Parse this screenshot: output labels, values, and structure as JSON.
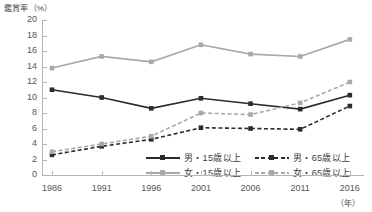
{
  "chart_data": {
    "type": "line",
    "title": "鑑賞率（%）",
    "ylabel": "鑑賞率（%）",
    "xlabel": "（年）",
    "x_unit_label": "（年）",
    "categories": [
      "1986",
      "1991",
      "1996",
      "2001",
      "2006",
      "2011",
      "2016"
    ],
    "x": [
      1986,
      1991,
      1996,
      2001,
      2006,
      2011,
      2016
    ],
    "ylim": [
      0,
      20
    ],
    "yticks": [
      "2",
      "4",
      "6",
      "8",
      "10",
      "12",
      "14",
      "16",
      "18",
      "20"
    ],
    "ytick_values": [
      2,
      4,
      6,
      8,
      10,
      12,
      14,
      16,
      18,
      20
    ],
    "grid": false,
    "legend_position": "bottom",
    "series": [
      {
        "name": "男・15歳以上",
        "key": "male15",
        "style": "solid",
        "color": "#2b2b2b",
        "marker": "square",
        "values": [
          11.0,
          10.0,
          8.6,
          9.9,
          9.2,
          8.5,
          10.3
        ]
      },
      {
        "name": "男・65歳以上",
        "key": "male65",
        "style": "dashed",
        "color": "#2b2b2b",
        "marker": "square",
        "values": [
          2.6,
          3.7,
          4.6,
          6.1,
          6.0,
          5.9,
          8.9
        ]
      },
      {
        "name": "女・15歳以上",
        "key": "female15",
        "style": "solid",
        "color": "#a8a8a8",
        "marker": "square",
        "values": [
          13.8,
          15.3,
          14.6,
          16.8,
          15.6,
          15.3,
          17.5
        ]
      },
      {
        "name": "女・65歳以上",
        "key": "female65",
        "style": "dashed",
        "color": "#a8a8a8",
        "marker": "square",
        "values": [
          3.0,
          4.0,
          5.0,
          8.0,
          7.8,
          9.3,
          12.0
        ]
      }
    ]
  },
  "legend": {
    "items": [
      {
        "label": "男・15歳以上",
        "color": "#2b2b2b",
        "style": "solid"
      },
      {
        "label": "男・65歳以上",
        "color": "#2b2b2b",
        "style": "dashed"
      },
      {
        "label": "女・15歳以上",
        "color": "#a8a8a8",
        "style": "solid"
      },
      {
        "label": "女・65歳以上",
        "color": "#a8a8a8",
        "style": "dashed"
      }
    ]
  },
  "colors": {
    "male": "#2b2b2b",
    "female": "#a8a8a8",
    "axis": "#b4b4b4",
    "text": "#3c3c3c",
    "background": "#ffffff"
  }
}
